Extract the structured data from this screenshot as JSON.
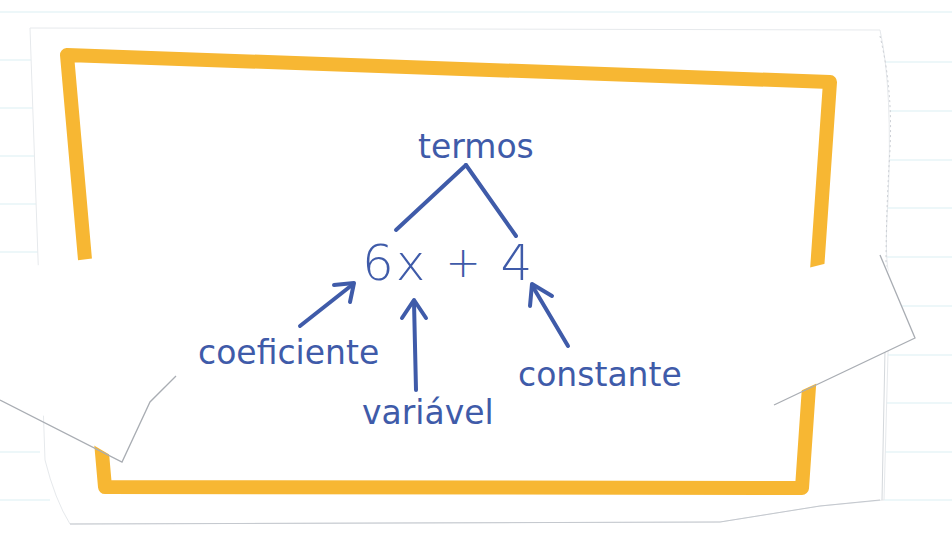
{
  "diagram": {
    "top_label": "termos",
    "expression": {
      "coefficient": "6",
      "variable": "x",
      "operator": "+",
      "constant": "4"
    },
    "labels": {
      "coefficient": "coeficiente",
      "variable": "variável",
      "constant": "constante"
    }
  },
  "colors": {
    "ink": "#3F5BA9",
    "frame": "#F7B733",
    "paper": "#FFFFFF",
    "ruled_lines": "#D6EEF4",
    "paper_edge": "#B9BEC4"
  }
}
